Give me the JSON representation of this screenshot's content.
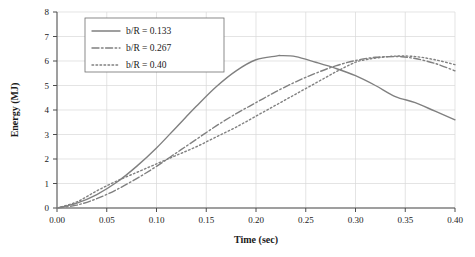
{
  "chart_data": {
    "type": "line",
    "title": "",
    "xlabel": "Time (sec)",
    "ylabel": "Energy (MJ)",
    "xlim": [
      0.0,
      0.4
    ],
    "ylim": [
      0,
      8
    ],
    "xticks": [
      "0.00",
      "0.05",
      "0.10",
      "0.15",
      "0.20",
      "0.25",
      "0.30",
      "0.35",
      "0.40"
    ],
    "yticks": [
      "0",
      "1",
      "2",
      "3",
      "4",
      "5",
      "6",
      "7",
      "8"
    ],
    "grid": "both-light",
    "legend_position": "upper-left-inside",
    "series": [
      {
        "name": "b/R = 0.133",
        "style": "solid",
        "color": "#808080",
        "x": [
          0.0,
          0.02,
          0.04,
          0.06,
          0.08,
          0.1,
          0.12,
          0.14,
          0.16,
          0.18,
          0.2,
          0.22,
          0.225,
          0.24,
          0.26,
          0.28,
          0.3,
          0.32,
          0.34,
          0.36,
          0.38,
          0.4
        ],
        "y": [
          0.0,
          0.2,
          0.55,
          1.05,
          1.7,
          2.45,
          3.3,
          4.15,
          4.95,
          5.6,
          6.05,
          6.2,
          6.22,
          6.18,
          5.95,
          5.7,
          5.4,
          5.0,
          4.55,
          4.3,
          3.95,
          3.6
        ]
      },
      {
        "name": "b/R = 0.267",
        "style": "dash-dot",
        "color": "#808080",
        "x": [
          0.0,
          0.02,
          0.04,
          0.06,
          0.08,
          0.1,
          0.12,
          0.14,
          0.16,
          0.18,
          0.2,
          0.22,
          0.24,
          0.26,
          0.28,
          0.3,
          0.32,
          0.34,
          0.345,
          0.36,
          0.38,
          0.4
        ],
        "y": [
          0.0,
          0.12,
          0.38,
          0.75,
          1.2,
          1.7,
          2.25,
          2.8,
          3.35,
          3.85,
          4.3,
          4.75,
          5.15,
          5.5,
          5.8,
          6.02,
          6.15,
          6.18,
          6.18,
          6.1,
          5.9,
          5.6
        ]
      },
      {
        "name": "b/R = 0.40",
        "style": "dotted",
        "color": "#808080",
        "x": [
          0.0,
          0.02,
          0.04,
          0.06,
          0.08,
          0.1,
          0.12,
          0.14,
          0.16,
          0.18,
          0.2,
          0.22,
          0.24,
          0.26,
          0.28,
          0.3,
          0.31,
          0.32,
          0.34,
          0.36,
          0.38,
          0.4
        ],
        "y": [
          0.0,
          0.25,
          0.7,
          1.1,
          1.45,
          1.8,
          2.15,
          2.5,
          2.9,
          3.3,
          3.75,
          4.2,
          4.65,
          5.1,
          5.55,
          5.95,
          6.05,
          6.12,
          6.2,
          6.18,
          6.05,
          5.85
        ]
      }
    ]
  }
}
